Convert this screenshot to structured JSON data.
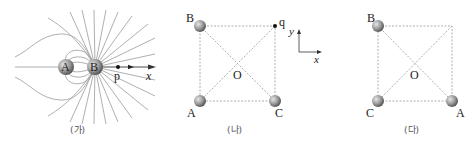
{
  "panels": [
    {
      "id": "ga",
      "caption": "(가)",
      "charges": [
        {
          "label": "A",
          "x": 66,
          "y": 67
        },
        {
          "label": "B",
          "x": 95,
          "y": 67
        }
      ],
      "point": {
        "label": "p",
        "x": 118,
        "y": 67
      },
      "axis": {
        "label": "x"
      }
    },
    {
      "id": "na",
      "caption": "(나)",
      "corners": {
        "top_left": "B",
        "top_right": "q",
        "bottom_left": "A",
        "bottom_right": "C"
      },
      "center": "O",
      "axes": {
        "x": "x",
        "y": "y"
      }
    },
    {
      "id": "da",
      "caption": "(다)",
      "corners": {
        "top_left": "B",
        "top_right": "",
        "bottom_left": "C",
        "bottom_right": "A"
      },
      "center": "O"
    }
  ],
  "colors": {
    "line": "#8a8a8a",
    "dashed": "#9a9a9a",
    "ball_light": "#d8d8d8",
    "ball_dark": "#6a6a6a",
    "text": "#222222"
  }
}
